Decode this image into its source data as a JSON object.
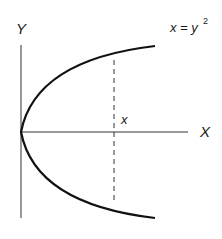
{
  "diagram": {
    "title_equation": {
      "base": "x = y",
      "exponent": "2"
    },
    "axis_labels": {
      "y": "Y",
      "x": "X"
    },
    "marker_label": "x",
    "curve": "x = y^2 (sideways parabola opening right)",
    "colors": {
      "line": "#1a1a1a",
      "background": "#ffffff"
    }
  }
}
